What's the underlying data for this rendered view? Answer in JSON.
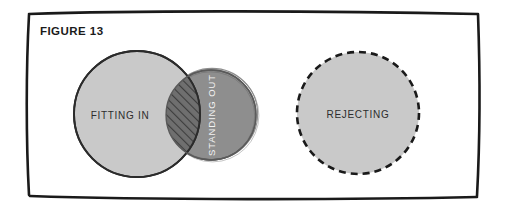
{
  "figure": {
    "label": "FIGURE 13",
    "frame_color": "#1a1a1a",
    "background_color": "#ffffff"
  },
  "diagram": {
    "type": "venn-diagram",
    "circles": [
      {
        "id": "fitting-in",
        "label": "FITTING IN",
        "fill": "#c9c9c9",
        "stroke": "#2b2b2b",
        "stroke_style": "solid",
        "label_color": "#2d2d2d",
        "cx": 137,
        "cy": 114,
        "r": 63
      },
      {
        "id": "standing-out",
        "label": "STANDING OUT",
        "fill": "#8e8e8e",
        "stroke": "#4a4a4a",
        "stroke_style": "sketchy",
        "label_color": "#f2f2f2",
        "label_rotation": -90,
        "cx": 211,
        "cy": 115,
        "r": 45
      },
      {
        "id": "rejecting",
        "label": "REJECTING",
        "fill": "#c9c9c9",
        "stroke": "#1a1a1a",
        "stroke_style": "dashed",
        "label_color": "#2d2d2d",
        "cx": 358,
        "cy": 113,
        "r": 61
      }
    ],
    "overlap": {
      "id": "fitting-in-standing-out-overlap",
      "pattern": "diagonal-hatch",
      "fill": "#6f6f6f",
      "hatch_color": "#3a3a3a"
    }
  }
}
